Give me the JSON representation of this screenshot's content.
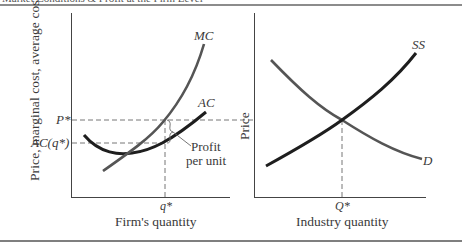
{
  "figure": {
    "title_partially_visible": "Market Conditions & Profit at the Firm Level",
    "colors": {
      "ink": "#2e2e2e",
      "gray_curve": "#555555",
      "dash": "#777777",
      "rule": "#666666"
    }
  },
  "left_panel": {
    "y_axis_label": "Price, marginal cost, average cost",
    "x_axis_label": "Firm's quantity",
    "x_tick": "q*",
    "y_ticks": {
      "price": "P*",
      "avg_cost": "AC(q*)"
    },
    "curves": {
      "mc": "MC",
      "ac": "AC"
    },
    "annotation": {
      "line1": "Profit",
      "line2": "per unit"
    }
  },
  "right_panel": {
    "y_axis_label": "Price",
    "x_axis_label": "Industry quantity",
    "x_tick": "Q*",
    "curves": {
      "supply": "SS",
      "demand": "D"
    }
  }
}
